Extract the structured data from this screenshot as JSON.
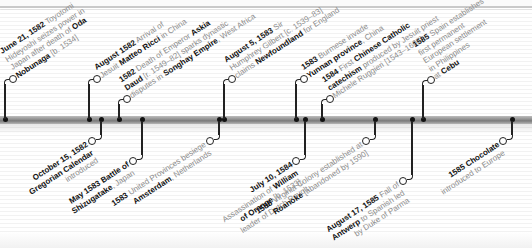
{
  "timeline": {
    "bar_color": "#8d8d8d",
    "connector_color": "#222222",
    "text_color_muted": "#8c8c8c",
    "text_color_bold": "#111111",
    "events_above": [
      {
        "id": "june-1582-toyotomi",
        "x": 5,
        "lines": [
          [
            {
              "t": "June 21, 1582",
              "b": true
            },
            {
              "t": " Toyotomi",
              "b": false
            }
          ],
          [
            {
              "t": "Hideyoshi seizes power in",
              "b": false
            }
          ],
          [
            {
              "t": "Japan after death of ",
              "b": false
            },
            {
              "t": "Oda",
              "b": true
            }
          ],
          [
            {
              "t": "Nobunaga",
              "b": true
            },
            {
              "t": " [b. 1534]",
              "b": false
            }
          ]
        ]
      },
      {
        "id": "aug-1582-ricci",
        "x": 89,
        "lines": [
          [
            {
              "t": "August 1582",
              "b": true
            },
            {
              "t": " Arrival of",
              "b": false
            }
          ],
          [
            {
              "t": "Jesuit ",
              "b": false
            },
            {
              "t": "Matteo Ricci",
              "b": true
            },
            {
              "t": " in China",
              "b": false
            }
          ]
        ]
      },
      {
        "id": "1582-askia-daud",
        "x": 119,
        "lines": [
          [
            {
              "t": "1582",
              "b": true
            },
            {
              "t": " Death of Emperor ",
              "b": false
            },
            {
              "t": "Askia",
              "b": true
            }
          ],
          [
            {
              "t": "Daud",
              "b": true
            },
            {
              "t": " [r. 1549–82] sparks dynastic",
              "b": false
            }
          ],
          [
            {
              "t": "disputes in ",
              "b": false
            },
            {
              "t": "Songhay Empire",
              "b": true
            },
            {
              "t": ", West Africa",
              "b": false
            }
          ]
        ]
      },
      {
        "id": "aug-1583-newfoundland",
        "x": 224,
        "lines": [
          [
            {
              "t": "August 5, 1583",
              "b": true
            },
            {
              "t": " Sir",
              "b": false
            }
          ],
          [
            {
              "t": "Humphrey Gilbert [c. 1539–83]",
              "b": false
            }
          ],
          [
            {
              "t": "claims ",
              "b": false
            },
            {
              "t": "Newfoundland",
              "b": true
            },
            {
              "t": " for England",
              "b": false
            }
          ]
        ]
      },
      {
        "id": "1583-yunnan",
        "x": 296,
        "lines": [
          [
            {
              "t": "1583",
              "b": true
            },
            {
              "t": " Burmese invade",
              "b": false
            }
          ],
          [
            {
              "t": "Yunnan province",
              "b": true
            },
            {
              "t": ", China",
              "b": false
            }
          ]
        ]
      },
      {
        "id": "1584-catechism",
        "x": 322,
        "lines": [
          [
            {
              "t": "1584",
              "b": true
            },
            {
              "t": " First ",
              "b": false
            },
            {
              "t": "Chinese Catholic",
              "b": true
            }
          ],
          [
            {
              "t": "catechism",
              "b": true
            },
            {
              "t": " produced by Jesuit priest",
              "b": false
            }
          ],
          [
            {
              "t": "Michele Ruggieri [1543–1607]",
              "b": false
            }
          ]
        ]
      },
      {
        "id": "1585-cebu",
        "x": 423,
        "lines": [
          [
            {
              "t": "1585",
              "b": true
            },
            {
              "t": " Spain establishes",
              "b": false
            }
          ],
          [
            {
              "t": "first permanent",
              "b": false
            }
          ],
          [
            {
              "t": "European settlement",
              "b": false
            }
          ],
          [
            {
              "t": "in Philippines",
              "b": false
            }
          ],
          [
            {
              "t": "at ",
              "b": false
            },
            {
              "t": "Cebu",
              "b": true
            }
          ]
        ]
      }
    ],
    "events_below": [
      {
        "id": "oct-1582-gregorian",
        "x": 101,
        "lines": [
          [
            {
              "t": "October 15, 1582",
              "b": true
            }
          ],
          [
            {
              "t": "Gregorian Calendar",
              "b": true
            }
          ],
          [
            {
              "t": "introduced",
              "b": false
            }
          ]
        ]
      },
      {
        "id": "may-1583-shizugatake",
        "x": 142,
        "lines": [
          [
            {
              "t": "May 1583 Battle of",
              "b": true
            }
          ],
          [
            {
              "t": "Shizugatake",
              "b": true
            },
            {
              "t": ", Japan",
              "b": false
            }
          ]
        ]
      },
      {
        "id": "1583-amsterdam",
        "x": 219,
        "lines": [
          [
            {
              "t": "1583",
              "b": true
            },
            {
              "t": " United Provinces besiege",
              "b": false
            }
          ],
          [
            {
              "t": "Amsterdam",
              "b": true
            },
            {
              "t": ", Netherlands",
              "b": false
            }
          ]
        ]
      },
      {
        "id": "july-1584-william",
        "x": 305,
        "lines": [
          [
            {
              "t": "July 10, 1584",
              "b": true
            }
          ],
          [
            {
              "t": "Assassination of ",
              "b": false
            },
            {
              "t": "William",
              "b": true
            }
          ],
          [
            {
              "t": "of Orange",
              "b": true
            },
            {
              "t": " [b. 1533],",
              "b": false
            }
          ],
          [
            {
              "t": "leader of Dutch Revolt",
              "b": false
            }
          ]
        ]
      },
      {
        "id": "1585-roanoke",
        "x": 375,
        "lines": [
          [
            {
              "t": "1585",
              "b": true
            },
            {
              "t": " Virginia Colony established at",
              "b": false
            }
          ],
          [
            {
              "t": "Roanoke",
              "b": true
            },
            {
              "t": " [abandoned by 1590]",
              "b": false
            }
          ]
        ]
      },
      {
        "id": "aug-1585-antwerp",
        "x": 412,
        "lines": [
          [
            {
              "t": "August 17, 1585",
              "b": true
            },
            {
              "t": " Fall of",
              "b": false
            }
          ],
          [
            {
              "t": "Antwerp",
              "b": true
            },
            {
              "t": " to Spanish led",
              "b": false
            }
          ],
          [
            {
              "t": "by Duke of Parma",
              "b": false
            }
          ]
        ]
      },
      {
        "id": "1585-chocolate",
        "x": 512,
        "lines": [
          [
            {
              "t": "1585 Chocolate",
              "b": true
            }
          ],
          [
            {
              "t": "introduced to Europe",
              "b": false
            }
          ]
        ]
      }
    ]
  }
}
